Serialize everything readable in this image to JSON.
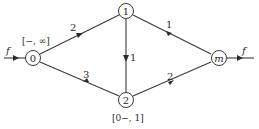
{
  "diagram": {
    "type": "flow-network",
    "nodes": [
      {
        "id": "0",
        "label": "0",
        "x": 33,
        "y": 58,
        "annotation": "[−, ∞]"
      },
      {
        "id": "1",
        "label": "1",
        "x": 126,
        "y": 11,
        "annotation": ""
      },
      {
        "id": "2",
        "label": "2",
        "x": 126,
        "y": 100,
        "annotation": "[0−, 1]"
      },
      {
        "id": "m",
        "label": "m",
        "x": 219,
        "y": 58,
        "annotation": ""
      }
    ],
    "edges": [
      {
        "from": "0",
        "to": "1",
        "capacity": "2"
      },
      {
        "from": "1",
        "to": "2",
        "capacity": "1"
      },
      {
        "from": "2",
        "to": "0",
        "capacity": "3"
      },
      {
        "from": "1",
        "to": "m",
        "capacity": "1"
      },
      {
        "from": "2",
        "to": "m",
        "capacity": "2"
      }
    ],
    "source_flow_label": "f",
    "sink_flow_label": "f"
  }
}
